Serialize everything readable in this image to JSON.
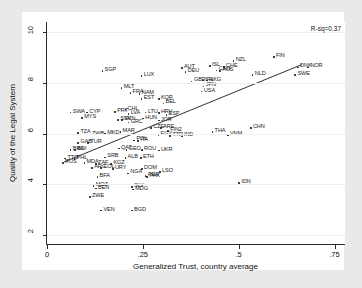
{
  "chart_data": {
    "type": "scatter",
    "title": "",
    "xlabel": "Generalized Trust, country average",
    "ylabel": "Quality of the Legal System",
    "xlim": [
      0,
      0.78
    ],
    "ylim": [
      1.6,
      10.4
    ],
    "xticks": [
      "0",
      ".25",
      ".5",
      ".75"
    ],
    "xtick_values": [
      0,
      0.25,
      0.5,
      0.75
    ],
    "yticks": [
      "2",
      "4",
      "6",
      "8",
      "10"
    ],
    "ytick_values": [
      2,
      4,
      6,
      8,
      10
    ],
    "grid": true,
    "legend": null,
    "annotations": [
      {
        "name": "rsq",
        "text": "R-sq=0.37"
      }
    ],
    "fit_line": {
      "type": "linear",
      "x_start": 0.045,
      "y_start": 4.88,
      "x_end": 0.665,
      "y_end": 8.72
    },
    "point_label_field": "iso3",
    "points": [
      {
        "iso3": "SGP",
        "x": 0.145,
        "y": 8.45
      },
      {
        "iso3": "LUX",
        "x": 0.247,
        "y": 8.25
      },
      {
        "iso3": "FIN",
        "x": 0.592,
        "y": 9.0
      },
      {
        "iso3": "NZL",
        "x": 0.487,
        "y": 8.85
      },
      {
        "iso3": "ISL",
        "x": 0.425,
        "y": 8.65
      },
      {
        "iso3": "CHE",
        "x": 0.462,
        "y": 8.62
      },
      {
        "iso3": "DNK",
        "x": 0.655,
        "y": 8.6
      },
      {
        "iso3": "NOR",
        "x": 0.682,
        "y": 8.6
      },
      {
        "iso3": "SWE",
        "x": 0.648,
        "y": 8.3
      },
      {
        "iso3": "NLD",
        "x": 0.537,
        "y": 8.3
      },
      {
        "iso3": "AUT",
        "x": 0.352,
        "y": 8.58
      },
      {
        "iso3": "DEU",
        "x": 0.362,
        "y": 8.43
      },
      {
        "iso3": "CAN",
        "x": 0.443,
        "y": 8.48
      },
      {
        "iso3": "AUS",
        "x": 0.452,
        "y": 8.45
      },
      {
        "iso3": "GBR",
        "x": 0.378,
        "y": 8.05
      },
      {
        "iso3": "IRL",
        "x": 0.408,
        "y": 8.08
      },
      {
        "iso3": "HKG",
        "x": 0.418,
        "y": 8.08
      },
      {
        "iso3": "JPN",
        "x": 0.409,
        "y": 7.85
      },
      {
        "iso3": "USA",
        "x": 0.404,
        "y": 7.65
      },
      {
        "iso3": "MLT",
        "x": 0.195,
        "y": 7.78
      },
      {
        "iso3": "FRA",
        "x": 0.218,
        "y": 7.6
      },
      {
        "iso3": "NAM",
        "x": 0.242,
        "y": 7.55
      },
      {
        "iso3": "EST",
        "x": 0.247,
        "y": 7.35
      },
      {
        "iso3": "KOR",
        "x": 0.292,
        "y": 7.35
      },
      {
        "iso3": "BEL",
        "x": 0.304,
        "y": 7.18
      },
      {
        "iso3": "SWA",
        "x": 0.062,
        "y": 6.82
      },
      {
        "iso3": "CYP",
        "x": 0.105,
        "y": 6.82
      },
      {
        "iso3": "MYS",
        "x": 0.092,
        "y": 6.6
      },
      {
        "iso3": "PRT",
        "x": 0.178,
        "y": 6.85
      },
      {
        "iso3": "CHL",
        "x": 0.205,
        "y": 6.92
      },
      {
        "iso3": "LVA",
        "x": 0.213,
        "y": 6.75
      },
      {
        "iso3": "LTU",
        "x": 0.258,
        "y": 6.82
      },
      {
        "iso3": "HRV",
        "x": 0.292,
        "y": 6.8
      },
      {
        "iso3": "ESP",
        "x": 0.312,
        "y": 6.72
      },
      {
        "iso3": "SVK",
        "x": 0.186,
        "y": 6.52
      },
      {
        "iso3": "SVN",
        "x": 0.196,
        "y": 6.52
      },
      {
        "iso3": "GRC",
        "x": 0.213,
        "y": 6.42
      },
      {
        "iso3": "HUN",
        "x": 0.251,
        "y": 6.58
      },
      {
        "iso3": "JOR",
        "x": 0.292,
        "y": 6.5
      },
      {
        "iso3": "TZA",
        "x": 0.082,
        "y": 6.02
      },
      {
        "iso3": "ZWB",
        "x": 0.112,
        "y": 5.95
      },
      {
        "iso3": "MKD",
        "x": 0.152,
        "y": 5.98
      },
      {
        "iso3": "MAR",
        "x": 0.192,
        "y": 6.05
      },
      {
        "iso3": "CZE",
        "x": 0.272,
        "y": 6.2
      },
      {
        "iso3": "ARE",
        "x": 0.298,
        "y": 6.2
      },
      {
        "iso3": "CHN",
        "x": 0.532,
        "y": 6.22
      },
      {
        "iso3": "THA",
        "x": 0.432,
        "y": 6.05
      },
      {
        "iso3": "VNM",
        "x": 0.472,
        "y": 5.92
      },
      {
        "iso3": "FIN2",
        "x": 0.316,
        "y": 6.08
      },
      {
        "iso3": "IND",
        "x": 0.352,
        "y": 5.88
      },
      {
        "iso3": "EGY",
        "x": 0.291,
        "y": 5.92
      },
      {
        "iso3": "TTR",
        "x": 0.322,
        "y": 5.9
      },
      {
        "iso3": "GAB",
        "x": 0.082,
        "y": 5.62
      },
      {
        "iso3": "TUR",
        "x": 0.108,
        "y": 5.62
      },
      {
        "iso3": "POL",
        "x": 0.228,
        "y": 5.72
      },
      {
        "iso3": "ITA",
        "x": 0.238,
        "y": 5.7
      },
      {
        "iso3": "BRA",
        "x": 0.062,
        "y": 5.35
      },
      {
        "iso3": "BDI",
        "x": 0.074,
        "y": 5.35
      },
      {
        "iso3": "GEO",
        "x": 0.208,
        "y": 5.35
      },
      {
        "iso3": "ROU",
        "x": 0.248,
        "y": 5.35
      },
      {
        "iso3": "UKR",
        "x": 0.292,
        "y": 5.32
      },
      {
        "iso3": "QAT",
        "x": 0.188,
        "y": 5.4
      },
      {
        "iso3": "TTO",
        "x": 0.048,
        "y": 5.0
      },
      {
        "iso3": "PHL",
        "x": 0.072,
        "y": 4.98
      },
      {
        "iso3": "RUS",
        "x": 0.042,
        "y": 4.82
      },
      {
        "iso3": "MDA",
        "x": 0.098,
        "y": 4.82
      },
      {
        "iso3": "ZAF",
        "x": 0.128,
        "y": 4.78
      },
      {
        "iso3": "KGZ",
        "x": 0.168,
        "y": 4.8
      },
      {
        "iso3": "ALB",
        "x": 0.205,
        "y": 5.02
      },
      {
        "iso3": "ETH",
        "x": 0.245,
        "y": 5.02
      },
      {
        "iso3": "SRB",
        "x": 0.152,
        "y": 5.05
      },
      {
        "iso3": "ARG",
        "x": 0.118,
        "y": 4.62
      },
      {
        "iso3": "COL",
        "x": 0.142,
        "y": 4.62
      },
      {
        "iso3": "URY",
        "x": 0.172,
        "y": 4.6
      },
      {
        "iso3": "DOM",
        "x": 0.248,
        "y": 4.6
      },
      {
        "iso3": "LSO",
        "x": 0.295,
        "y": 4.48
      },
      {
        "iso3": "NGA",
        "x": 0.212,
        "y": 4.42
      },
      {
        "iso3": "PER",
        "x": 0.258,
        "y": 4.32
      },
      {
        "iso3": "PAK",
        "x": 0.262,
        "y": 4.28
      },
      {
        "iso3": "BFA",
        "x": 0.132,
        "y": 4.28
      },
      {
        "iso3": "IDN",
        "x": 0.502,
        "y": 4.05
      },
      {
        "iso3": "MOZ",
        "x": 0.122,
        "y": 3.92
      },
      {
        "iso3": "BEN",
        "x": 0.128,
        "y": 3.82
      },
      {
        "iso3": "SLV",
        "x": 0.222,
        "y": 3.88
      },
      {
        "iso3": "MDG",
        "x": 0.225,
        "y": 3.78
      },
      {
        "iso3": "ZWE",
        "x": 0.112,
        "y": 3.48
      },
      {
        "iso3": "VEN",
        "x": 0.142,
        "y": 2.95
      },
      {
        "iso3": "BGD",
        "x": 0.222,
        "y": 2.95
      }
    ]
  }
}
